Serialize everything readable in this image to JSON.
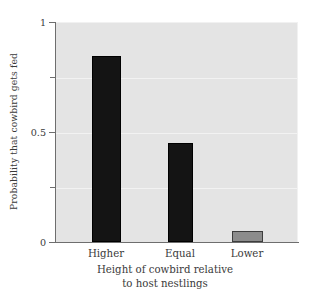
{
  "chart_data": {
    "type": "bar",
    "title": "",
    "categories": [
      "Higher",
      "Equal",
      "Lower"
    ],
    "values": [
      0.845,
      0.45,
      0.05
    ],
    "xlabel": "Height of cowbird relative to host nestlings",
    "xlabel_line1": "Height of cowbird relative",
    "xlabel_line2": "to host nestlings",
    "ylabel": "Probability that cowbird gets fed",
    "ylim": [
      0,
      1
    ],
    "xlim_categories": 3,
    "yticks": [
      0,
      0.5,
      1
    ],
    "ytick_labels": [
      "0",
      "0.5",
      "1"
    ],
    "yticks_minor": [
      0.25,
      0.75
    ],
    "grid": "horizontal-faint",
    "legend": "none",
    "bar_colors": [
      "#141414",
      "#141414",
      "#8c8c8c"
    ],
    "bar_edge_colors": [
      "#000000",
      "#000000",
      "#3d3d3d"
    ],
    "panel_background": "#e4e4e4",
    "figure_background": "#ffffff",
    "axis_color": "#6e6e6e",
    "gridline_color": "#f2f2f2",
    "text_color": "#3a3a3a"
  },
  "axes": {
    "y_title": "Probability that cowbird gets fed",
    "x_title_line1": "Height of cowbird relative",
    "x_title_line2": "to host nestlings",
    "y_tick_top": "1",
    "y_tick_mid": "0.5",
    "y_tick_bottom": "0"
  },
  "bars": [
    {
      "label": "Higher",
      "value": 0.845,
      "color": "#141414"
    },
    {
      "label": "Equal",
      "value": 0.45,
      "color": "#141414"
    },
    {
      "label": "Lower",
      "value": 0.05,
      "color": "#8c8c8c"
    }
  ]
}
